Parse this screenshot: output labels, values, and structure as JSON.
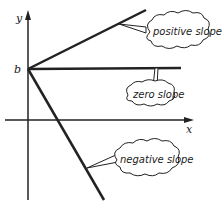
{
  "diagram": {
    "type": "linear-function-slopes",
    "axes": {
      "x_label": "x",
      "y_label": "y",
      "intercept_label": "b"
    },
    "lines": [
      {
        "name": "positive",
        "label": "positive slope"
      },
      {
        "name": "zero",
        "label": "zero slope"
      },
      {
        "name": "negative",
        "label": "negative slope"
      }
    ],
    "colors": {
      "ink": "#222222",
      "background": "#ffffff"
    }
  }
}
